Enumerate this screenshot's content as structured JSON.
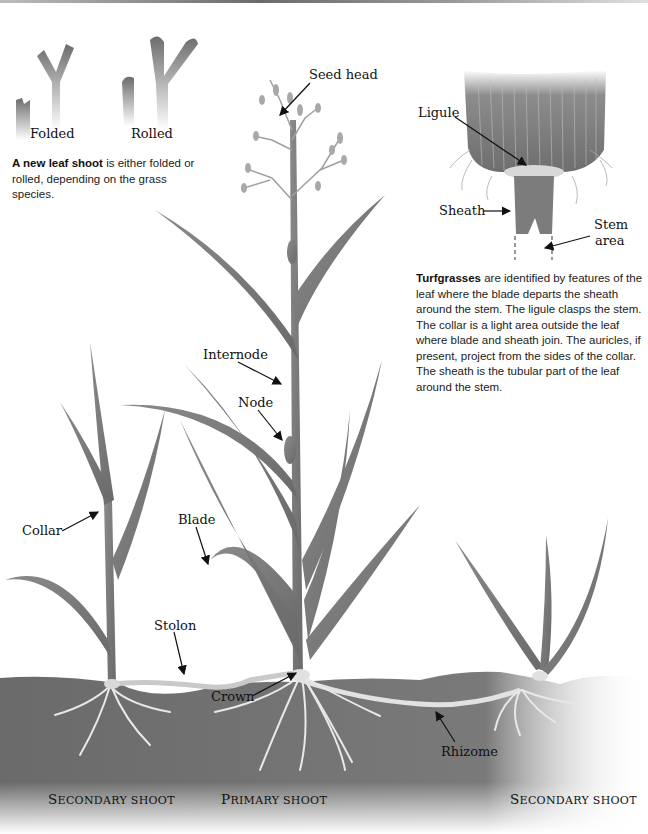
{
  "leaf_shoot": {
    "labels": {
      "folded": "Folded",
      "rolled": "Rolled"
    },
    "caption_bold": "A new leaf shoot",
    "caption_rest": " is either folded or rolled, depending on the grass species."
  },
  "ligule_detail": {
    "labels": {
      "ligule": "Ligule",
      "sheath": "Sheath",
      "stem_area_line1": "Stem",
      "stem_area_line2": "area"
    },
    "caption_bold": "Turfgrasses",
    "caption_rest": " are identified by features of the leaf where the blade departs the sheath around the stem. The ligule clasps the stem. The collar is a light area outside the leaf where blade and sheath join. The auricles, if present, project from the sides of the collar. The sheath is the tubular part of the leaf around the stem."
  },
  "plant_labels": {
    "seed_head": "Seed head",
    "internode": "Internode",
    "node": "Node",
    "collar": "Collar",
    "blade": "Blade",
    "stolon": "Stolon",
    "crown": "Crown",
    "rhizome": "Rhizome"
  },
  "shoot_titles": {
    "left": {
      "first": "S",
      "rest": "econdary shoot"
    },
    "center": {
      "first": "P",
      "rest": "rimary shoot"
    },
    "right": {
      "first": "S",
      "rest": "econdary shoot"
    }
  },
  "colors": {
    "leaf": "#7d7d7d",
    "leaf_dark": "#5e5e5e",
    "soil": "#6b6b6b",
    "root": "#e6e6e6",
    "text": "#111111"
  }
}
